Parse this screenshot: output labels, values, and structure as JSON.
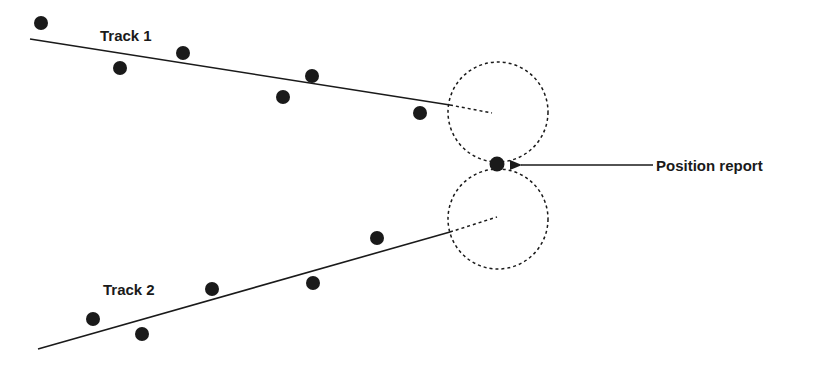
{
  "diagram": {
    "colors": {
      "ink": "#1a1a1a",
      "background": "#ffffff"
    },
    "tracks": [
      {
        "label": "Track 1",
        "label_pos": [
          100,
          41
        ],
        "line": {
          "from": [
            30,
            39
          ],
          "to": [
            450,
            105
          ]
        },
        "extrapolation": {
          "from": [
            450,
            105
          ],
          "to": [
            492,
            113
          ]
        },
        "points": [
          [
            41,
            23
          ],
          [
            120,
            68
          ],
          [
            183,
            53
          ],
          [
            283,
            97
          ],
          [
            312,
            76
          ],
          [
            420,
            113
          ]
        ]
      },
      {
        "label": "Track 2",
        "label_pos": [
          103,
          295
        ],
        "line": {
          "from": [
            38,
            349
          ],
          "to": [
            450,
            232
          ]
        },
        "extrapolation": {
          "from": [
            450,
            232
          ],
          "to": [
            497,
            217
          ]
        },
        "points": [
          [
            93,
            319
          ],
          [
            142,
            334
          ],
          [
            212,
            289
          ],
          [
            313,
            283
          ],
          [
            377,
            238
          ]
        ]
      }
    ],
    "gates": [
      {
        "cx": 498,
        "cy": 112,
        "r": 50
      },
      {
        "cx": 498,
        "cy": 219,
        "r": 50
      }
    ],
    "position_report": {
      "label": "Position report",
      "point": [
        497,
        164
      ],
      "arrow": {
        "from": [
          653,
          165
        ],
        "to": [
          521,
          165
        ]
      },
      "label_pos": [
        656,
        171
      ]
    }
  }
}
